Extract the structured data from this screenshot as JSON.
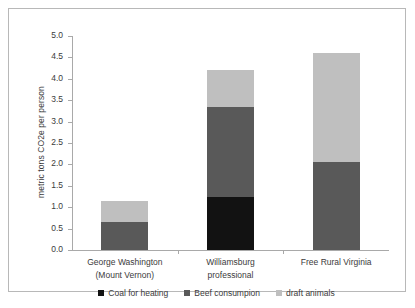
{
  "chart_data": {
    "type": "bar",
    "subtype": "stacked-bar",
    "title": "",
    "xlabel": "",
    "ylabel": "metric tons CO2e per person",
    "ylim": [
      0.0,
      5.0
    ],
    "ytick_step": 0.5,
    "ytick_labels": [
      "5.0",
      "4.5",
      "4.0",
      "3.5",
      "3.0",
      "2.5",
      "2.0",
      "1.5",
      "1.0",
      "0.5",
      "0.0"
    ],
    "ytick_values": [
      5.0,
      4.5,
      4.0,
      3.5,
      3.0,
      2.5,
      2.0,
      1.5,
      1.0,
      0.5,
      0.0
    ],
    "grid": false,
    "legend_position": "bottom",
    "categories": [
      "George Washington (Mount Vernon)",
      "Williamsburg professional",
      "Free Rural Virginia"
    ],
    "category_lines": [
      [
        "George Washington",
        "(Mount Vernon)"
      ],
      [
        "Williamsburg",
        "professional"
      ],
      [
        "Free Rural Virginia",
        ""
      ]
    ],
    "series": [
      {
        "name": "Coal for heating",
        "color": "#121212",
        "values": [
          0.0,
          1.25,
          0.0
        ]
      },
      {
        "name": "Beef consumpion",
        "color": "#595959",
        "values": [
          0.65,
          2.1,
          2.05
        ]
      },
      {
        "name": "draft animals",
        "color": "#bfbfbf",
        "values": [
          0.5,
          0.85,
          2.55
        ]
      }
    ],
    "totals": [
      1.15,
      4.2,
      4.6
    ]
  },
  "legend": {
    "items": [
      {
        "label": "Coal for heating",
        "color": "#121212"
      },
      {
        "label": "Beef consumpion",
        "color": "#595959"
      },
      {
        "label": "draft animals",
        "color": "#bfbfbf"
      }
    ]
  },
  "colors": {
    "background": "#ffffff",
    "frame_border": "#b8b8b8",
    "axis": "#a9a9a9",
    "text": "#3b3b3b"
  }
}
